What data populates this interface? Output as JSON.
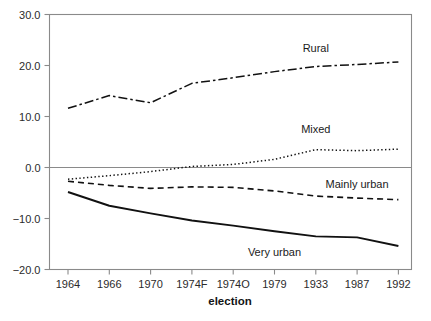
{
  "chart_data": {
    "type": "line",
    "title": "",
    "subtitle": "",
    "xlabel": "election",
    "ylabel": "",
    "grid": false,
    "legend_position": "inline-labels",
    "categories": [
      "1964",
      "1966",
      "1970",
      "1974F",
      "1974O",
      "1979",
      "1933",
      "1987",
      "1992"
    ],
    "ylim": [
      -20.0,
      30.0
    ],
    "yticks": [
      30.0,
      20.0,
      10.0,
      0.0,
      -10.0,
      -20.0
    ],
    "ytick_labels": [
      "30.0",
      "20.0",
      "10.0",
      "0.0",
      "-10.0",
      "-20.0"
    ],
    "zero_reference_line": 0.0,
    "series": [
      {
        "name": "Rural",
        "line_style": "dash-dot",
        "color": "#111111",
        "values": [
          11.6,
          14.1,
          12.7,
          16.5,
          17.6,
          18.8,
          19.8,
          20.2,
          20.7
        ],
        "label_x_category": "1933",
        "label_value": 23.5
      },
      {
        "name": "Mixed",
        "line_style": "dotted",
        "color": "#111111",
        "values": [
          -2.3,
          -1.6,
          -0.8,
          0.2,
          0.6,
          1.6,
          3.5,
          3.3,
          3.6
        ],
        "label_x_category": "1933",
        "label_value": 7.6
      },
      {
        "name": "Mainly urban",
        "line_style": "dashed",
        "color": "#111111",
        "values": [
          -2.7,
          -3.5,
          -4.1,
          -3.8,
          -3.9,
          -4.6,
          -5.6,
          -6.0,
          -6.3
        ],
        "label_x_category": "1987",
        "label_value": -3.2
      },
      {
        "name": "Very urban",
        "line_style": "solid",
        "color": "#111111",
        "values": [
          -4.8,
          -7.5,
          -9.0,
          -10.4,
          -11.4,
          -12.5,
          -13.5,
          -13.7,
          -15.4
        ],
        "label_x_category": "1979",
        "label_value": -16.6
      }
    ]
  }
}
